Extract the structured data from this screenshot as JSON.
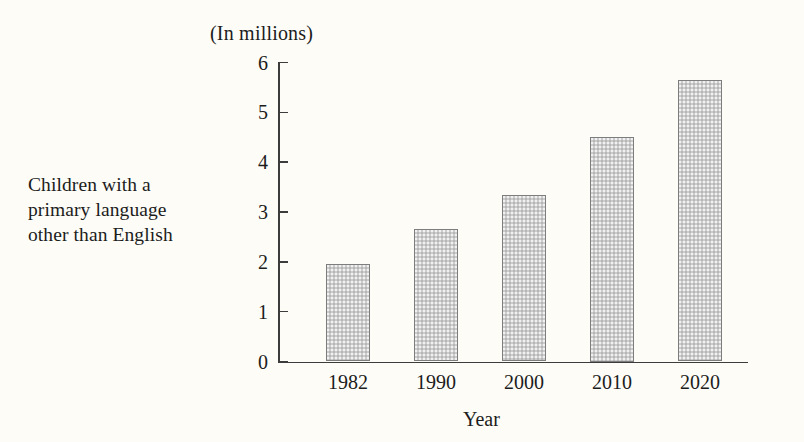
{
  "side_label": {
    "line1": "Children with a",
    "line2": "primary language",
    "line3": "other than English"
  },
  "chart_data": {
    "type": "bar",
    "title": "(In millions)",
    "subtitle": "",
    "xlabel": "Year",
    "ylabel": "",
    "categories": [
      "1982",
      "1990",
      "2000",
      "2010",
      "2020"
    ],
    "values": [
      1.95,
      2.65,
      3.35,
      4.5,
      5.65
    ],
    "ylim": [
      0,
      6
    ],
    "yticks": [
      "0",
      "1",
      "2",
      "3",
      "4",
      "5",
      "6"
    ],
    "ytick_values": [
      0,
      1,
      2,
      3,
      4,
      5,
      6
    ],
    "grid": false,
    "legend": "none",
    "bar_fill_color": "#cccccc",
    "bar_border_color": "#7d7d7d",
    "axis_color": "#3c3c3c",
    "background_color": "#fdfcf7",
    "series_label": "Children with a primary language other than English"
  }
}
